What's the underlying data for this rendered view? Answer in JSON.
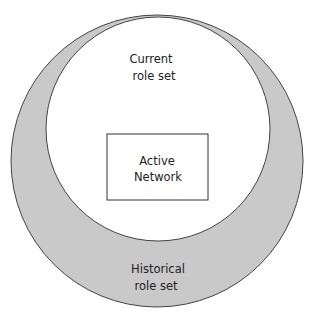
{
  "diagram": {
    "outer_circle": {
      "label_line1": "Historical",
      "label_line2": "role set",
      "fill": "#c9c9c9",
      "stroke": "#444444"
    },
    "inner_circle": {
      "label_line1": "Current",
      "label_line2": "role set",
      "fill": "#ffffff",
      "stroke": "#444444"
    },
    "box": {
      "label_line1": "Active",
      "label_line2": "Network",
      "fill": "#ffffff",
      "stroke": "#333333"
    }
  }
}
